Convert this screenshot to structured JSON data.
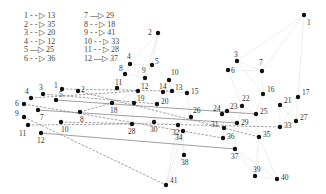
{
  "legend": [
    {
      "from": "1",
      "to": "13",
      "style": "dashed",
      "text": "1 - - ▷ 13"
    },
    {
      "from": "2",
      "to": "35",
      "style": "dashed",
      "text": "2 - - ▷ 35"
    },
    {
      "from": "3",
      "to": "20",
      "style": "dashed",
      "text": "3 - - ▷ 20"
    },
    {
      "from": "4",
      "to": "12",
      "style": "dashed",
      "text": "4 - - ▷ 12"
    },
    {
      "from": "5",
      "to": "25",
      "style": "solid",
      "text": "5 —▷ 25"
    },
    {
      "from": "6",
      "to": "36",
      "style": "dashed",
      "text": "6 - - ▷ 36"
    },
    {
      "from": "7",
      "to": "29",
      "style": "solid",
      "text": "7 —▷ 29"
    },
    {
      "from": "8",
      "to": "18",
      "style": "dashed",
      "text": "8 - - ▷ 18"
    },
    {
      "from": "9",
      "to": "41",
      "style": "dashed",
      "text": "9 - - ▷ 41"
    },
    {
      "from": "10",
      "to": "33",
      "style": "dashed",
      "text": "10 - - ▷ 33"
    },
    {
      "from": "11",
      "to": "28",
      "style": "dashed",
      "text": "11 - - ▷ 28"
    },
    {
      "from": "12",
      "to": "37",
      "style": "solid",
      "text": "12 —▷ 37"
    }
  ],
  "source_nodes": [
    {
      "id": "1",
      "x": 62,
      "y": 89,
      "lx": -8,
      "ly": -1
    },
    {
      "id": "2",
      "x": 78,
      "y": 91,
      "lx": 3,
      "ly": 1
    },
    {
      "id": "3",
      "x": 43,
      "y": 94,
      "lx": -4,
      "ly": -4
    },
    {
      "id": "4",
      "x": 31,
      "y": 98,
      "lx": -6,
      "ly": -4
    },
    {
      "id": "5",
      "x": 56,
      "y": 100,
      "lx": 3,
      "ly": -3
    },
    {
      "id": "6",
      "x": 24,
      "y": 104,
      "lx": -9,
      "ly": 2
    },
    {
      "id": "7",
      "x": 38,
      "y": 110,
      "lx": 2,
      "ly": 10
    },
    {
      "id": "8",
      "x": 80,
      "y": 112,
      "lx": 0,
      "ly": 10
    },
    {
      "id": "9",
      "x": 24,
      "y": 117,
      "lx": -9,
      "ly": -1
    },
    {
      "id": "10",
      "x": 61,
      "y": 122,
      "lx": 0,
      "ly": 10
    },
    {
      "id": "11",
      "x": 28,
      "y": 125,
      "lx": -9,
      "ly": 11
    },
    {
      "id": "12",
      "x": 41,
      "y": 133,
      "lx": -4,
      "ly": 10
    }
  ],
  "target_nodes": [
    {
      "id": "1",
      "x": 304,
      "y": 15,
      "lx": 3,
      "ly": 10
    },
    {
      "id": "2",
      "x": 158,
      "y": 33,
      "lx": -10,
      "ly": 2
    },
    {
      "id": "3",
      "x": 237,
      "y": 61,
      "lx": -3,
      "ly": -4
    },
    {
      "id": "4",
      "x": 130,
      "y": 64,
      "lx": -3,
      "ly": -5
    },
    {
      "id": "5",
      "x": 152,
      "y": 65,
      "lx": 3,
      "ly": -1
    },
    {
      "id": "6",
      "x": 228,
      "y": 70,
      "lx": 3,
      "ly": 3
    },
    {
      "id": "7",
      "x": 262,
      "y": 71,
      "lx": -3,
      "ly": -6
    },
    {
      "id": "8",
      "x": 125,
      "y": 74,
      "lx": -6,
      "ly": -3
    },
    {
      "id": "9",
      "x": 145,
      "y": 78,
      "lx": -3,
      "ly": -5
    },
    {
      "id": "10",
      "x": 169,
      "y": 80,
      "lx": 2,
      "ly": -5
    },
    {
      "id": "11",
      "x": 117,
      "y": 88,
      "lx": -2,
      "ly": -3
    },
    {
      "id": "12",
      "x": 138,
      "y": 91,
      "lx": 3,
      "ly": -2
    },
    {
      "id": "13",
      "x": 172,
      "y": 91,
      "lx": 3,
      "ly": -1
    },
    {
      "id": "14",
      "x": 163,
      "y": 92,
      "lx": -4,
      "ly": -3
    },
    {
      "id": "15",
      "x": 187,
      "y": 93,
      "lx": 4,
      "ly": 1
    },
    {
      "id": "16",
      "x": 263,
      "y": 94,
      "lx": 4,
      "ly": -2
    },
    {
      "id": "17",
      "x": 298,
      "y": 97,
      "lx": 4,
      "ly": -2
    },
    {
      "id": "18",
      "x": 112,
      "y": 103,
      "lx": -2,
      "ly": 10
    },
    {
      "id": "19",
      "x": 134,
      "y": 103,
      "lx": 3,
      "ly": -2
    },
    {
      "id": "20",
      "x": 157,
      "y": 104,
      "lx": 4,
      "ly": 0
    },
    {
      "id": "21",
      "x": 280,
      "y": 105,
      "lx": 4,
      "ly": -2
    },
    {
      "id": "22",
      "x": 242,
      "y": 106,
      "lx": 0,
      "ly": -5
    },
    {
      "id": "23",
      "x": 227,
      "y": 111,
      "lx": 3,
      "ly": -2
    },
    {
      "id": "24",
      "x": 222,
      "y": 114,
      "lx": -9,
      "ly": -3
    },
    {
      "id": "25",
      "x": 256,
      "y": 114,
      "lx": 4,
      "ly": 0
    },
    {
      "id": "26",
      "x": 191,
      "y": 117,
      "lx": 2,
      "ly": -4
    },
    {
      "id": "27",
      "x": 296,
      "y": 121,
      "lx": 4,
      "ly": -1
    },
    {
      "id": "28",
      "x": 132,
      "y": 124,
      "lx": -4,
      "ly": 10
    },
    {
      "id": "29",
      "x": 237,
      "y": 123,
      "lx": 4,
      "ly": 2
    },
    {
      "id": "30",
      "x": 154,
      "y": 122,
      "lx": -4,
      "ly": 10
    },
    {
      "id": "31",
      "x": 224,
      "y": 128,
      "lx": -13,
      "ly": -1
    },
    {
      "id": "32",
      "x": 178,
      "y": 125,
      "lx": -6,
      "ly": 10
    },
    {
      "id": "33",
      "x": 280,
      "y": 127,
      "lx": 4,
      "ly": 1
    },
    {
      "id": "34",
      "x": 183,
      "y": 131,
      "lx": -8,
      "ly": 9
    },
    {
      "id": "35",
      "x": 259,
      "y": 137,
      "lx": 4,
      "ly": 0
    },
    {
      "id": "36",
      "x": 223,
      "y": 138,
      "lx": 4,
      "ly": 1
    },
    {
      "id": "37",
      "x": 235,
      "y": 149,
      "lx": -4,
      "ly": 10
    },
    {
      "id": "38",
      "x": 184,
      "y": 155,
      "lx": -3,
      "ly": 10
    },
    {
      "id": "39",
      "x": 255,
      "y": 176,
      "lx": -2,
      "ly": -4
    },
    {
      "id": "40",
      "x": 277,
      "y": 179,
      "lx": 4,
      "ly": 1
    },
    {
      "id": "41",
      "x": 166,
      "y": 185,
      "lx": 4,
      "ly": -2
    }
  ],
  "colors": {
    "node": "#111111",
    "mapping_edge": "#777777",
    "mesh_edge": "#e2e2e2",
    "label": "#333333"
  }
}
